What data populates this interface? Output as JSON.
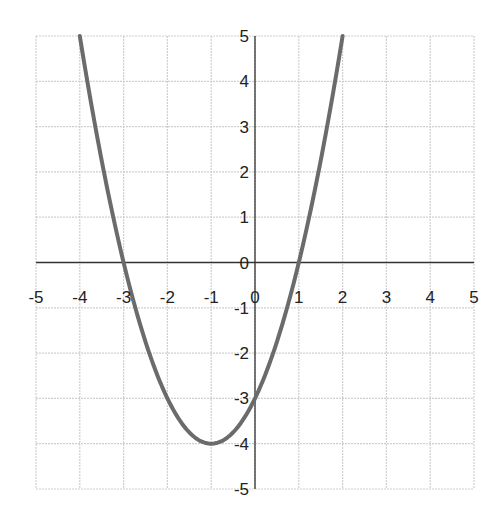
{
  "chart_data": {
    "type": "line",
    "title": "",
    "xlabel": "",
    "ylabel": "",
    "function": "y = x^2 + 2x - 3",
    "xlim": [
      -5,
      5
    ],
    "ylim": [
      -5,
      5
    ],
    "grid": true,
    "legend": null,
    "x_ticks": [
      "-5",
      "-4",
      "-3",
      "-2",
      "-1",
      "0",
      "1",
      "2",
      "3",
      "4",
      "5"
    ],
    "y_ticks": [
      "5",
      "4",
      "3",
      "2",
      "1",
      "0",
      "-1",
      "-2",
      "-3",
      "-4",
      "-5"
    ],
    "series": [
      {
        "name": "parabola",
        "x": [
          -4,
          -3.5,
          -3,
          -2.5,
          -2,
          -1.5,
          -1,
          -0.5,
          0,
          0.5,
          1,
          1.5,
          2
        ],
        "y": [
          5,
          2.25,
          0,
          -1.75,
          -3,
          -3.75,
          -4,
          -3.75,
          -3,
          -1.75,
          0,
          2.25,
          5
        ]
      }
    ],
    "annotations": {
      "vertex": [
        -1,
        -4
      ],
      "roots": [
        -3,
        1
      ],
      "y_intercept": -3
    }
  },
  "colors": {
    "curve": "#6b6b6b",
    "grid": "#cfcfcf",
    "axis": "#333333",
    "text": "#222222"
  }
}
